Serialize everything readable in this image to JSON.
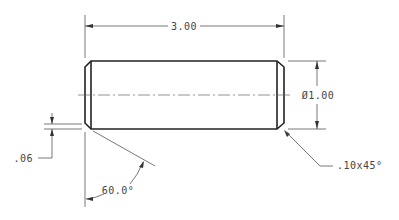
{
  "drawing": {
    "type": "cylindrical pin with chamfered ends",
    "dimensions": {
      "length": "3.00",
      "diameter": "Ø1.00",
      "chamfer_depth": ".06",
      "chamfer_angle": "60.0°",
      "chamfer_callout": ".10x45°"
    },
    "colors": {
      "background": "#ffffff",
      "object_line": "#222222",
      "dimension_line": "#555555",
      "text": "#444444"
    }
  }
}
